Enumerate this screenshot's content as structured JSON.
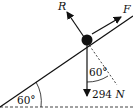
{
  "diagram": {
    "type": "free-body force diagram on inclined plane",
    "forces": {
      "reaction": {
        "label": "R"
      },
      "applied": {
        "label": "F"
      },
      "weight": {
        "value": "294",
        "unit": "N"
      }
    },
    "angles": {
      "incline_angle": "60°",
      "weight_angle": "60°"
    },
    "colors": {
      "ink": "#111111",
      "background": "#ffffff"
    }
  }
}
